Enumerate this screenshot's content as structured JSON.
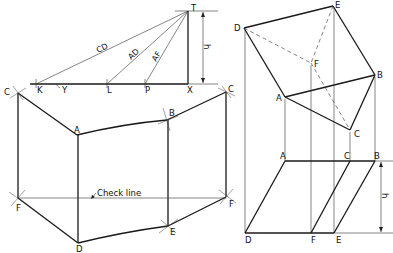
{
  "left_figure": {
    "true_length_labels": [
      "CD",
      "AD",
      "AF"
    ],
    "baseline_points": [
      "K",
      "Y",
      "L",
      "P",
      "X"
    ],
    "apex": "T",
    "height_label": "h",
    "development_points": {
      "top": [
        "C",
        "A",
        "B",
        "C"
      ],
      "bottom": [
        "F",
        "D",
        "E",
        "F"
      ]
    },
    "check_line_label": "Check line"
  },
  "right_figure": {
    "plan_points": [
      "D",
      "E",
      "F",
      "B",
      "A",
      "C"
    ],
    "elevation_top": [
      "A",
      "C",
      "B"
    ],
    "elevation_bottom": [
      "D",
      "F",
      "E"
    ],
    "height_label": "h"
  }
}
